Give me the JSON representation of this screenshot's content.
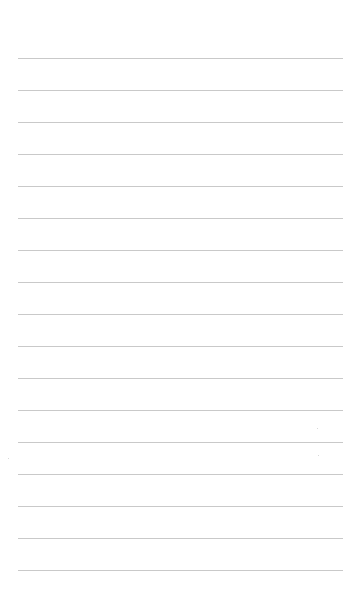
{
  "page": {
    "type": "lined-paper",
    "background_color": "#ffffff",
    "line_color": "#c9c9c9",
    "line_left": 18,
    "line_width": 325,
    "first_line_y": 58,
    "line_spacing": 32,
    "line_count": 17,
    "text_content": ""
  }
}
